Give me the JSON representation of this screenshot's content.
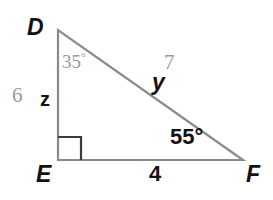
{
  "figure": {
    "type": "right-triangle-diagram",
    "background_color": "#ffffff",
    "stroke_color": "#8a8a8a",
    "given_label_color": "#9a9a9a",
    "solved_label_color": "#121212",
    "vertices": {
      "D": {
        "label": "D",
        "x": 58,
        "y": 30
      },
      "E": {
        "label": "E",
        "x": 58,
        "y": 160
      },
      "F": {
        "label": "F",
        "x": 243,
        "y": 160
      }
    },
    "right_angle": {
      "at_vertex": "E",
      "marker": "square",
      "size": 23
    },
    "angles": [
      {
        "at_vertex": "D",
        "text": "35",
        "degree_symbol": "°",
        "style": "given"
      },
      {
        "at_vertex": "F",
        "text": "55°",
        "style": "solved"
      }
    ],
    "sides": [
      {
        "name": "DE",
        "given_value": "6",
        "variable": "z"
      },
      {
        "name": "DF",
        "given_value": "7",
        "variable": "y"
      },
      {
        "name": "EF",
        "value": "4"
      }
    ]
  }
}
